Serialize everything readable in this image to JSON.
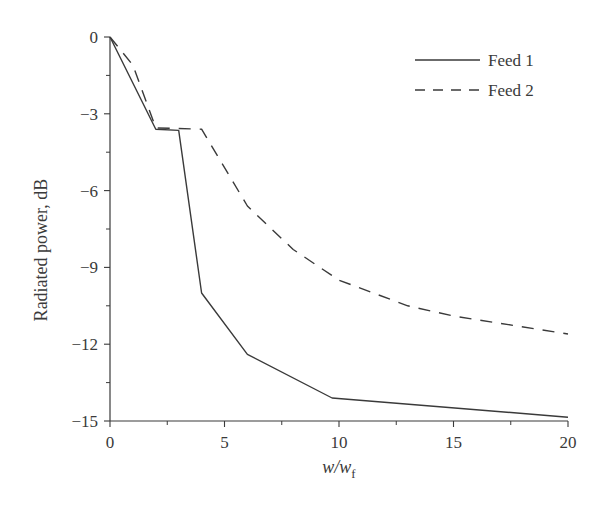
{
  "chart_data": {
    "type": "line",
    "title": "",
    "xlabel": "w/w_f",
    "xlabel_main": "w/w",
    "xlabel_sub": "f",
    "ylabel": "Radiated power, dB",
    "xlim": [
      0,
      20
    ],
    "ylim": [
      -15,
      0
    ],
    "xticks": [
      0,
      5,
      10,
      15,
      20
    ],
    "xticks_minor": [
      2.5,
      7.5,
      12.5,
      17.5
    ],
    "yticks": [
      0,
      -3,
      -6,
      -9,
      -12,
      -15
    ],
    "yticks_minor": [
      -1.5,
      -4.5,
      -7.5,
      -10.5,
      -13.5
    ],
    "xtick_labels": [
      "0",
      "5",
      "10",
      "15",
      "20"
    ],
    "ytick_labels": [
      "0",
      "−3",
      "−6",
      "−9",
      "−12",
      "−15"
    ],
    "grid": false,
    "legend_position": "upper right",
    "series": [
      {
        "name": "Feed 1",
        "style": "solid",
        "x": [
          0,
          2,
          3,
          4,
          6,
          9.7,
          20
        ],
        "y": [
          0,
          -3.6,
          -3.65,
          -10.0,
          -12.4,
          -14.1,
          -14.85
        ]
      },
      {
        "name": "Feed 2",
        "style": "dashed",
        "x": [
          0,
          1,
          2,
          4,
          6,
          8,
          10,
          13,
          15,
          20
        ],
        "y": [
          0,
          -1.1,
          -3.55,
          -3.6,
          -6.6,
          -8.3,
          -9.5,
          -10.5,
          -10.9,
          -11.6
        ]
      }
    ]
  },
  "colors": {
    "line": "#3a3a3a",
    "axis": "#3a3a3a",
    "background": "#ffffff"
  }
}
